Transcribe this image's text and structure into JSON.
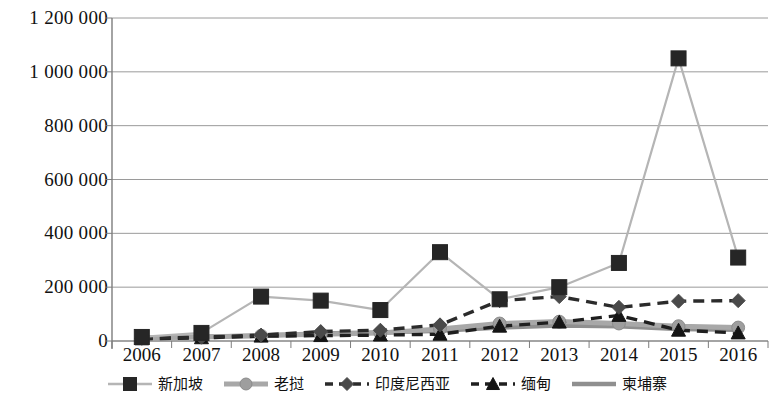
{
  "chart_data": {
    "type": "line",
    "title": "",
    "subtitle": "",
    "xlabel": "",
    "ylabel": "",
    "categories": [
      "2006",
      "2007",
      "2008",
      "2009",
      "2010",
      "2011",
      "2012",
      "2013",
      "2014",
      "2015",
      "2016"
    ],
    "x": [
      2006,
      2007,
      2008,
      2009,
      2010,
      2011,
      2012,
      2013,
      2014,
      2015,
      2016
    ],
    "ylim": [
      0,
      1200000
    ],
    "ytick_labels": [
      "1 200 000",
      "1 000 000",
      "800 000",
      "600 000",
      "400 000",
      "200 000",
      "0"
    ],
    "ytick_values": [
      1200000,
      1000000,
      800000,
      600000,
      400000,
      200000,
      0
    ],
    "grid": true,
    "legend_position": "bottom",
    "series": [
      {
        "name": "新加坡",
        "marker": "square",
        "marker_color": "#262626",
        "line_color": "#b5b5b5",
        "line_style": "solid",
        "values": [
          15000,
          30000,
          165000,
          150000,
          115000,
          330000,
          155000,
          200000,
          290000,
          1050000,
          310000
        ]
      },
      {
        "name": "老挝",
        "marker": "circle",
        "marker_color": "#9e9e9e",
        "line_color": "#a8a8a8",
        "line_style": "solid",
        "values": [
          12000,
          15000,
          20000,
          25000,
          30000,
          45000,
          65000,
          72000,
          65000,
          55000,
          50000
        ]
      },
      {
        "name": "印度尼西亚",
        "marker": "diamond",
        "marker_color": "#4a4a4a",
        "line_color": "#2b2b2b",
        "line_style": "dashed",
        "values": [
          10000,
          14000,
          22000,
          35000,
          40000,
          60000,
          150000,
          165000,
          125000,
          148000,
          150000
        ]
      },
      {
        "name": "缅甸",
        "marker": "triangle",
        "marker_color": "#151515",
        "line_color": "#1f1f1f",
        "line_style": "dashed",
        "values": [
          8000,
          12000,
          18000,
          20000,
          22000,
          25000,
          55000,
          70000,
          95000,
          40000,
          30000
        ]
      },
      {
        "name": "柬埔寨",
        "marker": "none",
        "marker_color": "#a0a0a0",
        "line_color": "#8f8f8f",
        "line_style": "solid",
        "values": [
          11000,
          16000,
          20000,
          28000,
          32000,
          38000,
          50000,
          58000,
          55000,
          45000,
          42000
        ]
      }
    ]
  },
  "axis": {
    "y_labels": [
      "1 200 000",
      "1 000 000",
      "800 000",
      "600 000",
      "400 000",
      "200 000",
      "0"
    ],
    "x_labels": [
      "2006",
      "2007",
      "2008",
      "2009",
      "2010",
      "2011",
      "2012",
      "2013",
      "2014",
      "2015",
      "2016"
    ]
  },
  "legend": {
    "items": [
      {
        "label": "新加坡",
        "marker": "square"
      },
      {
        "label": "老挝",
        "marker": "circle"
      },
      {
        "label": "印度尼西亚",
        "marker": "diamond"
      },
      {
        "label": "缅甸",
        "marker": "triangle"
      },
      {
        "label": "柬埔寨",
        "marker": "none"
      }
    ]
  },
  "colors": {
    "background": "#ffffff",
    "grid": "#9a9a9a",
    "axis": "#7d7d7d",
    "text": "#111111",
    "singapore_marker": "#262626",
    "singapore_line": "#b5b5b5",
    "laos_marker": "#9e9e9e",
    "laos_line": "#a8a8a8",
    "indonesia_marker": "#4a4a4a",
    "indonesia_line": "#2b2b2b",
    "myanmar_marker": "#151515",
    "myanmar_line": "#1f1f1f",
    "cambodia_line": "#8f8f8f"
  }
}
